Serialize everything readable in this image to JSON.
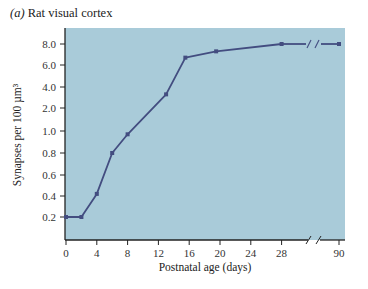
{
  "panel": {
    "letter": "(a)",
    "title": "Rat visual cortex"
  },
  "colors": {
    "plot_bg": "#a9cbd9",
    "line": "#434d80",
    "axis": "#222222"
  },
  "chart_data": {
    "type": "line",
    "title": "Rat visual cortex",
    "xlabel": "Postnatal age (days)",
    "ylabel": "Synapses per 100 µm³",
    "x_ticks": [
      "0",
      "4",
      "8",
      "12",
      "16",
      "20",
      "24",
      "28",
      "90"
    ],
    "y_ticks": [
      "0.2",
      "0.4",
      "0.6",
      "0.8",
      "1.0",
      "2.0",
      "4.0",
      "6.0",
      "8.0"
    ],
    "x_axis_break": "between 28 and 90",
    "y_scale": "non-linear (0.2–1.0 step 0.2, then 2.0–8.0 step 2.0)",
    "grid": false,
    "legend": null,
    "series": [
      {
        "name": "Rat visual cortex",
        "x": [
          0,
          2,
          4,
          6,
          8,
          13,
          15.5,
          19.5,
          28,
          90
        ],
        "y": [
          0.2,
          0.2,
          0.42,
          0.8,
          0.97,
          3.3,
          6.7,
          7.3,
          8.0,
          8.0
        ]
      }
    ]
  }
}
